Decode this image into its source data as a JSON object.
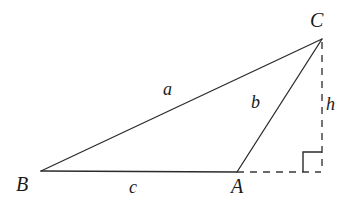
{
  "figure": {
    "kind": "geometry-diagram",
    "background_color": "#ffffff",
    "stroke_color": "#2b2b2b",
    "stroke_width": 1.2
  },
  "vertices": [
    {
      "id": "B",
      "label": "B",
      "x": 41,
      "y": 171
    },
    {
      "id": "A",
      "label": "A",
      "x": 237,
      "y": 172
    },
    {
      "id": "C",
      "label": "C",
      "x": 322,
      "y": 39
    },
    {
      "id": "F",
      "label": "",
      "x": 322,
      "y": 172
    }
  ],
  "vertex_labels": [
    {
      "name": "vertex-label-B",
      "text": "B"
    },
    {
      "name": "vertex-label-A",
      "text": "A"
    },
    {
      "name": "vertex-label-C",
      "text": "C"
    }
  ],
  "segments": [
    {
      "name": "side-a-BC",
      "from": "B",
      "to": "C",
      "style": "solid",
      "label": "a"
    },
    {
      "name": "side-c-BA",
      "from": "B",
      "to": "A",
      "style": "solid",
      "label": "c"
    },
    {
      "name": "side-b-AC",
      "from": "A",
      "to": "C",
      "style": "solid",
      "label": "b"
    },
    {
      "name": "altitude-h-CF",
      "from": "C",
      "to": "F",
      "style": "dashed",
      "label": "h"
    },
    {
      "name": "base-extension-AF",
      "from": "A",
      "to": "F",
      "style": "dashed",
      "label": ""
    }
  ],
  "side_labels": [
    {
      "name": "side-label-a",
      "text": "a"
    },
    {
      "name": "side-label-b",
      "text": "b"
    },
    {
      "name": "side-label-c",
      "text": "c"
    },
    {
      "name": "side-label-h",
      "text": "h"
    }
  ],
  "right_angle_marker": {
    "name": "right-angle-marker",
    "at_vertex": "F",
    "size": 19,
    "style": "solid"
  },
  "geometry_paths": {
    "side_a": "M 41 171 L 322 39",
    "side_c": "M 41 171 L 237 172",
    "side_b": "M 237 172 L 322 39",
    "altitude_h": "M 322 42 L 322 172",
    "base_extension": "M 237 172 L 321 172",
    "right_angle": "M 303 172 L 303 152 L 322 152"
  }
}
